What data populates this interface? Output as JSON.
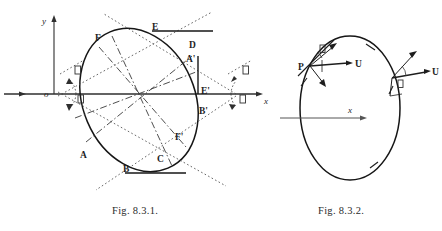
{
  "figure1": {
    "id": "fig-8-3-1",
    "caption": "Fig. 8.3.1.",
    "axes": {
      "x_label": "x",
      "y_label": "y",
      "origin_label": "o"
    },
    "points": [
      {
        "label": "F",
        "x": 95,
        "y": 41
      },
      {
        "label": "E",
        "x": 152,
        "y": 30
      },
      {
        "label": "D",
        "x": 189,
        "y": 48
      },
      {
        "label": "A'",
        "x": 186,
        "y": 62
      },
      {
        "label": "E'",
        "x": 201,
        "y": 94
      },
      {
        "label": "B'",
        "x": 199,
        "y": 114
      },
      {
        "label": "F'",
        "x": 175,
        "y": 140
      },
      {
        "label": "C",
        "x": 157,
        "y": 162
      },
      {
        "label": "B",
        "x": 123,
        "y": 172
      },
      {
        "label": "A",
        "x": 80,
        "y": 158
      }
    ],
    "angle_labels": [
      {
        "name": "angle-alpha-upper-left",
        "glyph": "□",
        "x": 68,
        "y": 72
      },
      {
        "name": "angle-beta-lower-left",
        "glyph": "□",
        "x": 71,
        "y": 100
      },
      {
        "name": "angle-alpha-upper-right",
        "glyph": "□",
        "x": 241,
        "y": 71
      },
      {
        "name": "angle-beta-lower-right",
        "glyph": "□",
        "x": 238,
        "y": 100
      }
    ],
    "line_styles": {
      "ellipse": "solid",
      "conjugate_diameters": "dash-dot",
      "tangents": "dotted",
      "axes": "solid",
      "tangent_segments": "solid"
    }
  },
  "figure2": {
    "id": "fig-8-3-2",
    "caption": "Fig. 8.3.2.",
    "axes": {
      "x_label": "x"
    },
    "points": [
      {
        "label": "P",
        "x": 303,
        "y": 64
      }
    ],
    "vectors": [
      {
        "label": "U",
        "name": "velocity-vector-left",
        "x": 347,
        "y": 68
      },
      {
        "label": "U",
        "name": "velocity-vector-right",
        "x": 432,
        "y": 74
      }
    ],
    "angle_labels": [
      {
        "name": "angle-theta-left",
        "glyph": "□",
        "x": 320,
        "y": 54
      },
      {
        "name": "angle-theta-right",
        "glyph": "□",
        "x": 398,
        "y": 82
      }
    ],
    "line_styles": {
      "ellipse": "solid",
      "tangent": "solid",
      "vectors": "solid-arrow"
    }
  },
  "colors": {
    "ink": "#1a1a1a",
    "background": "#ffffff",
    "line": "#2f2f2f",
    "faint": "#555555"
  }
}
